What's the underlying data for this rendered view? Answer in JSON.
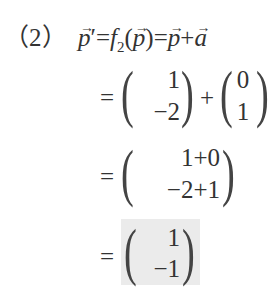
{
  "problem_label": "（2）",
  "line1": {
    "lhs": "p",
    "prime": "′",
    "eq1": "=",
    "func": "f",
    "sub": "2",
    "open": "(",
    "arg": "p",
    "close": ")",
    "eq2": "=",
    "term1": "p",
    "plus": "+",
    "term2": "a"
  },
  "steps": [
    {
      "eq": "=",
      "vectors": [
        {
          "top": "1",
          "bottom": "−2"
        },
        {
          "top": "0",
          "bottom": "1"
        }
      ],
      "op": "+"
    },
    {
      "eq": "=",
      "vectors": [
        {
          "top": "1+0",
          "bottom": "−2+1"
        }
      ]
    },
    {
      "eq": "=",
      "vectors": [
        {
          "top": "1",
          "bottom": "−1"
        }
      ],
      "highlighted": true
    }
  ],
  "highlight_color": "#ebebeb"
}
